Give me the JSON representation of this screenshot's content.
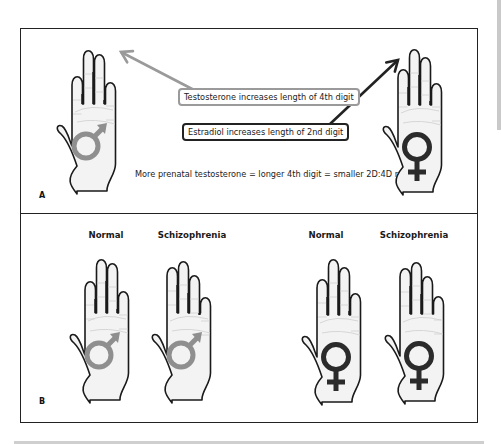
{
  "panel_a": {
    "letter": "A",
    "testosterone_label": "Testosterone increases length of 4th digit",
    "estradiol_label": "Estradiol increases length of 2nd digit",
    "caption": "More prenatal testosterone = longer 4th digit = smaller 2D:4D ratio",
    "hands": [
      {
        "id": "male-hand",
        "symbol": "male",
        "x": 55,
        "y": 46,
        "fingers": [
          30,
          12,
          14,
          36
        ]
      },
      {
        "id": "female-hand",
        "symbol": "female",
        "x": 381,
        "y": 47,
        "fingers": [
          22,
          10,
          16,
          36
        ]
      }
    ],
    "arrows": [
      {
        "name": "testosterone-arrow",
        "color": "#9a9a9a",
        "x1": 196,
        "y1": 91,
        "x2": 121,
        "y2": 52
      },
      {
        "name": "estradiol-arrow",
        "color": "#222222",
        "x1": 330,
        "y1": 124,
        "x2": 398,
        "y2": 60
      }
    ]
  },
  "panel_b": {
    "letter": "B",
    "columns": [
      {
        "label": "Normal",
        "x": 106
      },
      {
        "label": "Schizophrenia",
        "x": 192
      },
      {
        "label": "Normal",
        "x": 326
      },
      {
        "label": "Schizophrenia",
        "x": 414
      }
    ],
    "hands": [
      {
        "id": "male-normal-hand",
        "symbol": "male",
        "x": 68,
        "y": 255,
        "fingers": [
          26,
          12,
          14,
          36
        ]
      },
      {
        "id": "male-schizophrenia-hand",
        "symbol": "male",
        "x": 150,
        "y": 255,
        "fingers": [
          12,
          14,
          26,
          42
        ]
      },
      {
        "id": "female-normal-hand",
        "symbol": "female",
        "x": 300,
        "y": 257,
        "fingers": [
          22,
          10,
          16,
          36
        ]
      },
      {
        "id": "female-schizophrenia-hand",
        "symbol": "female",
        "x": 383,
        "y": 256,
        "fingers": [
          12,
          14,
          26,
          40
        ]
      }
    ]
  },
  "colors": {
    "male_symbol": "#8f8f8f",
    "female_symbol": "#2b2b2b",
    "hand_fill": "#f3f3f3",
    "outline": "#1a1a1a"
  }
}
